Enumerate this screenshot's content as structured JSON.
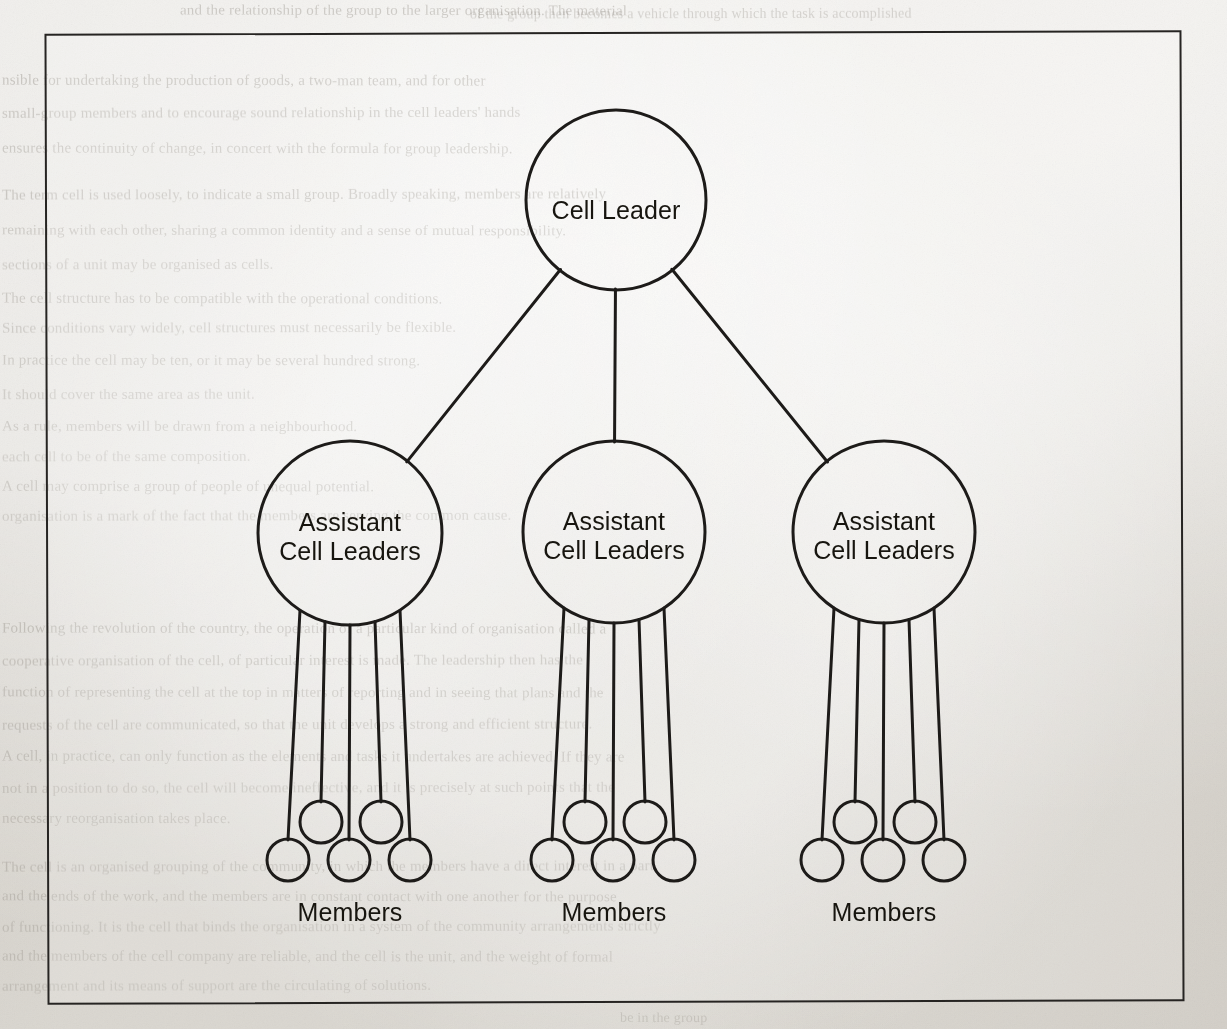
{
  "page": {
    "width": 1227,
    "height": 1029,
    "background_color": "#eceae5",
    "ink_color": "#1d1b19"
  },
  "figure": {
    "frame": {
      "name": "figure-border",
      "x": 46,
      "y": 32,
      "width": 1137,
      "height": 971,
      "stroke_color": "#262422"
    },
    "root": {
      "id": "cell-leader",
      "label": "Cell Leader",
      "cx": 616,
      "cy": 200,
      "r": 90
    },
    "assistants": [
      {
        "id": "assistant-left",
        "label": "Assistant\nCell Leaders",
        "cx": 350,
        "cy": 533,
        "r": 92,
        "members_label": "Members"
      },
      {
        "id": "assistant-middle",
        "label": "Assistant\nCell Leaders",
        "cx": 614,
        "cy": 532,
        "r": 91,
        "members_label": "Members"
      },
      {
        "id": "assistant-right",
        "label": "Assistant\nCell Leaders",
        "cx": 884,
        "cy": 532,
        "r": 91,
        "members_label": "Members"
      }
    ],
    "member_cluster": {
      "count_per_assistant": 5,
      "upper_row": [
        {
          "dx": -29,
          "cy": 822,
          "r": 21
        },
        {
          "dx": 31,
          "cy": 822,
          "r": 21
        }
      ],
      "lower_row": [
        {
          "dx": -62,
          "cy": 860,
          "r": 21
        },
        {
          "dx": -1,
          "cy": 860,
          "r": 21
        },
        {
          "dx": 60,
          "cy": 860,
          "r": 21
        }
      ],
      "stem_attach_offsets": [
        -50,
        -25,
        0,
        25,
        50
      ],
      "label_y": 898
    },
    "labels": {
      "root_label": "Cell Leader",
      "assistant_label_line1": "Assistant",
      "assistant_label_line2": "Cell Leaders",
      "members_label": "Members"
    }
  },
  "background_text": {
    "note": "Faint bleed-through text visible behind the figure on the scanned page",
    "lines": [
      {
        "text": "and the relationship of the group to the larger organisation. The material",
        "x": 180,
        "y": 2,
        "size": 15,
        "opacity": 0.3
      },
      {
        "text": "of the group then becomes a vehicle through which the task is accomplished",
        "x": 470,
        "y": 6,
        "size": 14,
        "opacity": 0.26
      },
      {
        "text": "nsible for undertaking the production of goods, a two-man team, and for other",
        "x": 2,
        "y": 72,
        "size": 15,
        "opacity": 0.32
      },
      {
        "text": "small-group members and to encourage sound relationship in the cell leaders' hands",
        "x": 2,
        "y": 105,
        "size": 15,
        "opacity": 0.3
      },
      {
        "text": "ensures the continuity of change, in concert with the formula for group leadership.",
        "x": 2,
        "y": 140,
        "size": 15,
        "opacity": 0.28
      },
      {
        "text": "The term cell is used loosely, to indicate a small group. Broadly speaking, members are relatively",
        "x": 2,
        "y": 186,
        "size": 15,
        "opacity": 0.3
      },
      {
        "text": "remaining with each other, sharing a common identity and a sense of mutual responsibility.",
        "x": 2,
        "y": 222,
        "size": 15,
        "opacity": 0.27
      },
      {
        "text": "sections of a unit may be organised as cells.",
        "x": 2,
        "y": 256,
        "size": 15,
        "opacity": 0.26
      },
      {
        "text": "The cell structure has to be compatible with the operational conditions.",
        "x": 2,
        "y": 290,
        "size": 15,
        "opacity": 0.27
      },
      {
        "text": "Since conditions vary widely, cell structures must necessarily be flexible.",
        "x": 2,
        "y": 320,
        "size": 15,
        "opacity": 0.26
      },
      {
        "text": "In practice the cell may be ten, or it may be several hundred strong.",
        "x": 2,
        "y": 352,
        "size": 15,
        "opacity": 0.25
      },
      {
        "text": "It should cover the same area as the unit.",
        "x": 2,
        "y": 386,
        "size": 15,
        "opacity": 0.24
      },
      {
        "text": "As a rule, members will be drawn from a neighbourhood.",
        "x": 2,
        "y": 418,
        "size": 15,
        "opacity": 0.24
      },
      {
        "text": "each cell to be of the same composition.",
        "x": 2,
        "y": 448,
        "size": 15,
        "opacity": 0.22
      },
      {
        "text": "A cell may comprise a group of people of unequal potential.",
        "x": 2,
        "y": 478,
        "size": 15,
        "opacity": 0.24
      },
      {
        "text": "organisation is a mark of the fact that the members are serving the common cause.",
        "x": 2,
        "y": 508,
        "size": 15,
        "opacity": 0.23
      },
      {
        "text": "Following the revolution of the country, the operation of a particular kind of organisation called a",
        "x": 2,
        "y": 620,
        "size": 15,
        "opacity": 0.3
      },
      {
        "text": "cooperative organisation of the cell, of particular interest is made. The leadership then has the",
        "x": 2,
        "y": 652,
        "size": 15,
        "opacity": 0.29
      },
      {
        "text": "function of representing the cell at the top in matters of reporting and in seeing that plans and the",
        "x": 2,
        "y": 684,
        "size": 15,
        "opacity": 0.28
      },
      {
        "text": "requests of the cell are communicated, so that the unit develops a strong and efficient structure.",
        "x": 2,
        "y": 716,
        "size": 15,
        "opacity": 0.28
      },
      {
        "text": "A cell, in practice, can only function as the elements and tasks it undertakes are achieved. If they are",
        "x": 2,
        "y": 748,
        "size": 15,
        "opacity": 0.27
      },
      {
        "text": "not in a position to do so, the cell will become ineffective, and it is precisely at such points that the",
        "x": 2,
        "y": 780,
        "size": 15,
        "opacity": 0.26
      },
      {
        "text": "necessary reorganisation takes place.",
        "x": 2,
        "y": 810,
        "size": 15,
        "opacity": 0.26
      },
      {
        "text": "The cell is an organised grouping of the community, in which the members have a direct interest in a part",
        "x": 2,
        "y": 858,
        "size": 15,
        "opacity": 0.28
      },
      {
        "text": "and the ends of the work, and the members are in constant contact with one another for the purpose",
        "x": 2,
        "y": 888,
        "size": 15,
        "opacity": 0.27
      },
      {
        "text": "of functioning. It is the cell that binds the organisation in a system of the community arrangements strictly",
        "x": 2,
        "y": 918,
        "size": 15,
        "opacity": 0.26
      },
      {
        "text": "and the members of the cell company are reliable, and the cell is the unit, and the weight of formal",
        "x": 2,
        "y": 948,
        "size": 15,
        "opacity": 0.25
      },
      {
        "text": "arrangement and its means of support are the circulating of solutions.",
        "x": 2,
        "y": 978,
        "size": 15,
        "opacity": 0.24
      },
      {
        "text": "be in the group",
        "x": 620,
        "y": 1010,
        "size": 14,
        "opacity": 0.22
      }
    ]
  }
}
